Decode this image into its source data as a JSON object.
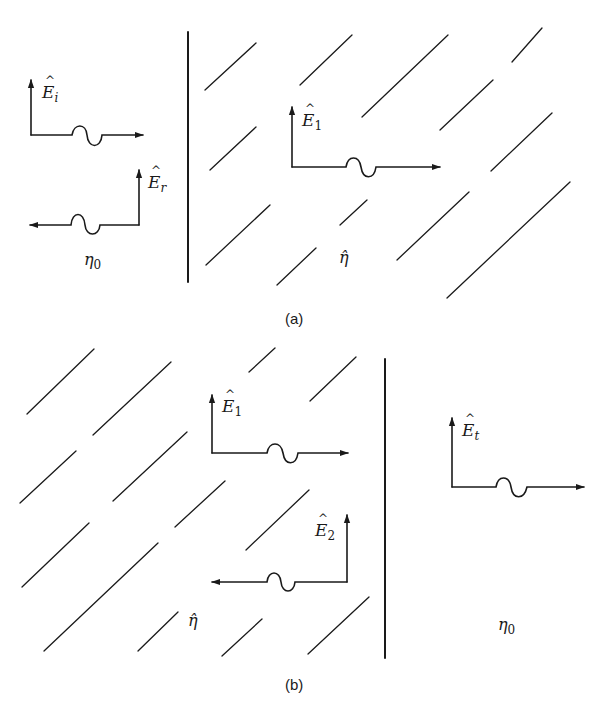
{
  "figure": {
    "panels": [
      {
        "id": "a",
        "caption": "(a)",
        "left_region": {
          "medium_label": "η",
          "medium_sub": "0"
        },
        "right_region": {
          "medium_label": "η̂"
        },
        "vectors": [
          {
            "name": "E",
            "sub": "i",
            "direction": "right",
            "role": "incident"
          },
          {
            "name": "E",
            "sub": "r",
            "direction": "left",
            "role": "reflected"
          },
          {
            "name": "E",
            "sub": "1",
            "direction": "right",
            "role": "forward wave in slab"
          }
        ]
      },
      {
        "id": "b",
        "caption": "(b)",
        "left_region": {
          "medium_label": "η̂"
        },
        "right_region": {
          "medium_label": "η",
          "medium_sub": "0"
        },
        "vectors": [
          {
            "name": "E",
            "sub": "1",
            "direction": "right",
            "role": "forward wave in slab"
          },
          {
            "name": "E",
            "sub": "2",
            "direction": "left",
            "role": "backward wave in slab"
          },
          {
            "name": "E",
            "sub": "t",
            "direction": "right",
            "role": "transmitted"
          }
        ]
      }
    ],
    "colors": {
      "ink": "#1a1a1a",
      "background": "#ffffff"
    }
  }
}
